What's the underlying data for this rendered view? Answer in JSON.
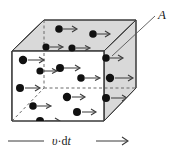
{
  "figure": {
    "type": "physics-schematic",
    "labels": {
      "area": "A",
      "length": "υ·dt",
      "length_parts": {
        "speed": "υ",
        "dot": "·",
        "differential": "d",
        "time": "t"
      }
    },
    "colors": {
      "face_shaded": "#d9d9d9",
      "face_front": "#ffffff",
      "edge": "#3a3a3a",
      "hidden_edge": "#6b6b6b",
      "particle": "#111111",
      "arrow": "#3a3a3a",
      "background": "#ffffff"
    },
    "geometry": {
      "front_face": [
        [
          12,
          51
        ],
        [
          12,
          121
        ],
        [
          104,
          121
        ],
        [
          104,
          51
        ]
      ],
      "back_face": [
        [
          44,
          20
        ],
        [
          44,
          88
        ],
        [
          136,
          88
        ],
        [
          136,
          20
        ]
      ],
      "top_face": [
        [
          12,
          51
        ],
        [
          44,
          20
        ],
        [
          136,
          20
        ],
        [
          104,
          51
        ]
      ],
      "right_face": [
        [
          104,
          51
        ],
        [
          136,
          20
        ],
        [
          136,
          88
        ],
        [
          104,
          121
        ]
      ],
      "left_face": [
        [
          12,
          51
        ],
        [
          44,
          20
        ],
        [
          44,
          88
        ],
        [
          12,
          121
        ]
      ],
      "hidden_edges": [
        [
          [
            44,
            20
          ],
          [
            44,
            88
          ]
        ],
        [
          [
            44,
            88
          ],
          [
            136,
            88
          ]
        ],
        [
          [
            12,
            121
          ],
          [
            44,
            88
          ]
        ]
      ]
    },
    "particles": [
      {
        "cx": 59,
        "cy": 29,
        "r": 3.8,
        "arrow_len": 14
      },
      {
        "cx": 93,
        "cy": 34,
        "r": 3.8,
        "arrow_len": 13
      },
      {
        "cx": 46,
        "cy": 47,
        "r": 3.6,
        "arrow_len": 13
      },
      {
        "cx": 72,
        "cy": 48,
        "r": 3.6,
        "arrow_len": 14
      },
      {
        "cx": 106,
        "cy": 58,
        "r": 3.8,
        "arrow_len": 13
      },
      {
        "cx": 23,
        "cy": 60,
        "r": 4.2,
        "arrow_len": 17
      },
      {
        "cx": 40,
        "cy": 71,
        "r": 3.6,
        "arrow_len": 13
      },
      {
        "cx": 60,
        "cy": 68,
        "r": 4.0,
        "arrow_len": 16
      },
      {
        "cx": 81,
        "cy": 78,
        "r": 3.8,
        "arrow_len": 14
      },
      {
        "cx": 110,
        "cy": 78,
        "r": 4.2,
        "arrow_len": 19
      },
      {
        "cx": 20,
        "cy": 88,
        "r": 4.0,
        "arrow_len": 16
      },
      {
        "cx": 67,
        "cy": 97,
        "r": 4.2,
        "arrow_len": 14
      },
      {
        "cx": 106,
        "cy": 98,
        "r": 4.0,
        "arrow_len": 17
      },
      {
        "cx": 33,
        "cy": 106,
        "r": 3.8,
        "arrow_len": 14
      },
      {
        "cx": 77,
        "cy": 112,
        "r": 4.0,
        "arrow_len": 15
      },
      {
        "cx": 40,
        "cy": 121,
        "r": 4.0,
        "arrow_len": 16
      }
    ],
    "leader_line": {
      "from": [
        112,
        56
      ],
      "to": [
        155,
        16
      ]
    },
    "length_rule": {
      "left_segment": [
        [
          8,
          141
        ],
        [
          44,
          141
        ]
      ],
      "right_segment": [
        [
          96,
          141
        ],
        [
          128,
          141
        ]
      ],
      "arrowhead_at": [
        128,
        141
      ]
    }
  }
}
